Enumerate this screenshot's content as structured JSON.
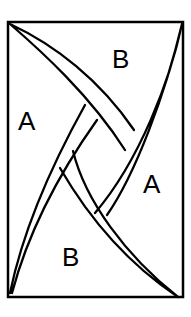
{
  "diagram": {
    "type": "tiling-diagram",
    "frame": {
      "x": 8,
      "y": 22,
      "width": 175,
      "height": 275
    },
    "labels": [
      {
        "text": "B",
        "x": 122,
        "y": 68,
        "region": "top"
      },
      {
        "text": "A",
        "x": 28,
        "y": 130,
        "region": "left"
      },
      {
        "text": "A",
        "x": 152,
        "y": 193,
        "region": "right"
      },
      {
        "text": "B",
        "x": 72,
        "y": 265,
        "region": "bottom"
      }
    ],
    "colors": {
      "stroke": "#000000",
      "background": "#ffffff"
    }
  }
}
